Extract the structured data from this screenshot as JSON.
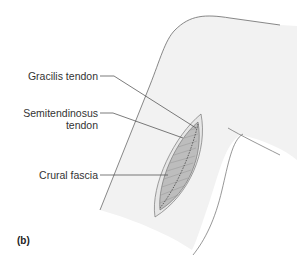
{
  "figure": {
    "panel_label": "(b)",
    "labels": [
      {
        "id": "gracilis",
        "text": "Gracilis tendon"
      },
      {
        "id": "semitendinosus_line1",
        "text": "Semitendinosus"
      },
      {
        "id": "semitendinosus_line2",
        "text": "tendon"
      },
      {
        "id": "crural",
        "text": "Crural fascia"
      }
    ],
    "colors": {
      "skin": "#f1f1f1",
      "outline": "#6a6a6a",
      "tendon": "#b9b9b9",
      "leader": "#444444"
    }
  }
}
